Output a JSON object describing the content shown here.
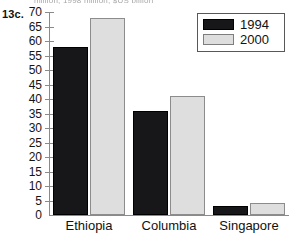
{
  "figure": {
    "number_label": "13c.",
    "clipped_caption": "million; 1998 million; $US billion"
  },
  "chart_data": {
    "type": "bar",
    "title": "",
    "subtitle": "",
    "xlabel": "",
    "ylabel": "",
    "categories": [
      "Ethiopia",
      "Columbia",
      "Singapore"
    ],
    "series": [
      {
        "name": "1994",
        "color": "#17171a",
        "values": [
          58,
          36,
          3
        ]
      },
      {
        "name": "2000",
        "color": "#dedede",
        "values": [
          68,
          41,
          4
        ]
      }
    ],
    "ylim": [
      0,
      70
    ],
    "ytick_step": 5,
    "yticks": [
      0,
      5,
      10,
      15,
      20,
      25,
      30,
      35,
      40,
      45,
      50,
      55,
      60,
      65,
      70
    ],
    "ytick_labels": [
      "0",
      "5",
      "10",
      "15",
      "20",
      "25",
      "30",
      "35",
      "40",
      "45",
      "50",
      "55",
      "60",
      "65",
      "70"
    ],
    "grid": false,
    "legend_position": "top-right",
    "legend_entries": [
      "1994",
      "2000"
    ]
  }
}
